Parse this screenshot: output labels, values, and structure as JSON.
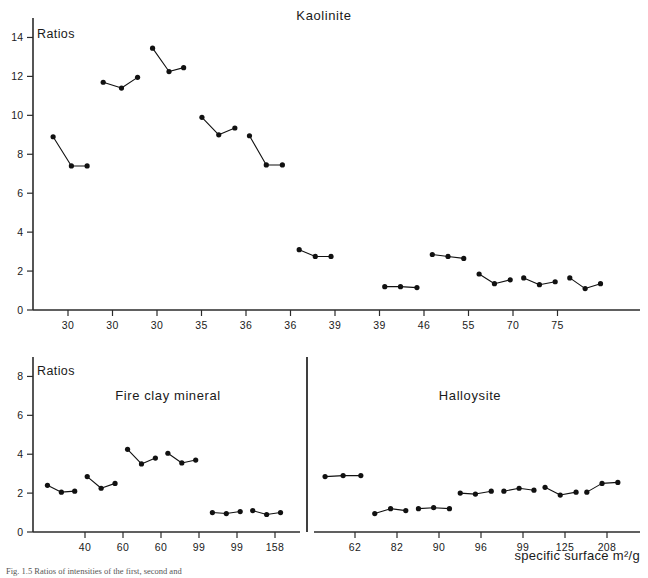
{
  "figure": {
    "caption": "Fig. 1.5   Ratios of intensities of the first, second and",
    "xaxis_title": "specific surface m²/g"
  },
  "chart_data": [
    {
      "type": "scatter",
      "title": "Kaolinite",
      "ylabel": "Ratios",
      "xlabel": "",
      "ylim": [
        0,
        15
      ],
      "yticks": [
        0,
        2,
        4,
        6,
        8,
        10,
        12,
        14
      ],
      "ytick_labels": [
        "0",
        "2",
        "4",
        "6",
        "8",
        "10",
        "12",
        "14"
      ],
      "xtick_labels": [
        "30",
        "30",
        "30",
        "35",
        "36",
        "36",
        "39",
        "39",
        "46",
        "55",
        "70",
        "75"
      ],
      "grid": false,
      "legend": "none",
      "note": "points grouped in connected triplets per sample",
      "groups": [
        {
          "x": [
            0.55,
            1.05,
            1.48
          ],
          "y": [
            8.9,
            7.4,
            7.4
          ]
        },
        {
          "x": [
            1.92,
            2.42,
            2.86
          ],
          "y": [
            11.7,
            11.4,
            11.95
          ]
        },
        {
          "x": [
            3.27,
            3.72,
            4.12
          ],
          "y": [
            13.45,
            12.25,
            12.45
          ]
        },
        {
          "x": [
            4.62,
            5.08,
            5.52
          ],
          "y": [
            9.9,
            9.0,
            9.35
          ]
        },
        {
          "x": [
            5.92,
            6.38,
            6.82
          ],
          "y": [
            8.95,
            7.45,
            7.45
          ]
        },
        {
          "x": [
            7.28,
            7.72,
            8.15
          ],
          "y": [
            3.1,
            2.75,
            2.75
          ]
        },
        {
          "x": [
            9.62,
            10.05,
            10.5
          ],
          "y": [
            1.2,
            1.2,
            1.15
          ]
        },
        {
          "x": [
            10.92,
            11.35,
            11.78
          ],
          "y": [
            2.85,
            2.75,
            2.65
          ]
        },
        {
          "x": [
            12.2,
            12.62,
            13.05
          ],
          "y": [
            1.85,
            1.35,
            1.55
          ]
        },
        {
          "x": [
            13.42,
            13.85,
            14.28
          ],
          "y": [
            1.65,
            1.3,
            1.45
          ]
        },
        {
          "x": [
            14.68,
            15.1,
            15.52
          ],
          "y": [
            1.65,
            1.1,
            1.35
          ]
        }
      ]
    },
    {
      "type": "scatter",
      "title": "Fire clay mineral",
      "ylabel": "Ratios",
      "xlabel": "",
      "ylim": [
        0,
        9
      ],
      "yticks": [
        0,
        2,
        4,
        6,
        8
      ],
      "ytick_labels": [
        "0",
        "2",
        "4",
        "6",
        "8"
      ],
      "xtick_labels": [
        "40",
        "60",
        "60",
        "99",
        "99",
        "158"
      ],
      "grid": false,
      "legend": "none",
      "groups": [
        {
          "x": [
            0.52,
            1.02,
            1.5
          ],
          "y": [
            2.4,
            2.05,
            2.1
          ]
        },
        {
          "x": [
            1.95,
            2.45,
            2.95
          ],
          "y": [
            2.85,
            2.25,
            2.5
          ]
        },
        {
          "x": [
            3.4,
            3.9,
            4.4
          ],
          "y": [
            4.25,
            3.5,
            3.8
          ]
        },
        {
          "x": [
            4.85,
            5.35,
            5.85
          ],
          "y": [
            4.05,
            3.55,
            3.7
          ]
        },
        {
          "x": [
            6.45,
            6.95,
            7.45
          ],
          "y": [
            1.0,
            0.95,
            1.05
          ]
        },
        {
          "x": [
            7.9,
            8.4,
            8.9
          ],
          "y": [
            1.1,
            0.9,
            1.0
          ]
        }
      ]
    },
    {
      "type": "scatter",
      "title": "Halloysite",
      "ylabel": "",
      "xlabel": "",
      "ylim": [
        0,
        9
      ],
      "yticks": [],
      "ytick_labels": [],
      "xtick_labels": [
        "62",
        "82",
        "90",
        "96",
        "99",
        "125",
        "208"
      ],
      "grid": false,
      "legend": "none",
      "groups": [
        {
          "x": [
            0.35,
            0.92,
            1.48
          ],
          "y": [
            2.85,
            2.9,
            2.9
          ]
        },
        {
          "x": [
            1.92,
            2.42,
            2.9
          ],
          "y": [
            0.95,
            1.2,
            1.1
          ]
        },
        {
          "x": [
            3.3,
            3.78,
            4.28
          ],
          "y": [
            1.2,
            1.25,
            1.2
          ]
        },
        {
          "x": [
            4.62,
            5.1,
            5.6
          ],
          "y": [
            2.0,
            1.95,
            2.1
          ]
        },
        {
          "x": [
            6.0,
            6.48,
            6.95
          ],
          "y": [
            2.1,
            2.25,
            2.15
          ]
        },
        {
          "x": [
            7.3,
            7.78,
            8.28
          ],
          "y": [
            2.3,
            1.9,
            2.05
          ]
        },
        {
          "x": [
            8.62,
            9.1,
            9.6
          ],
          "y": [
            2.05,
            2.5,
            2.55
          ]
        }
      ]
    }
  ]
}
